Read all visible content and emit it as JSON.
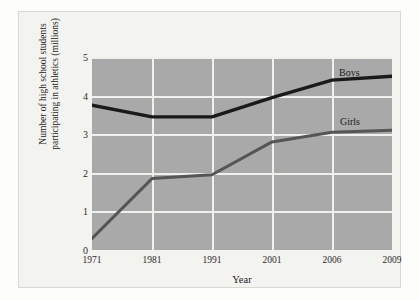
{
  "figure": {
    "background_color": "#f3f3f0",
    "plot_background_color": "#a9a9a9",
    "gridline_color": "#f0f0ec"
  },
  "axes": {
    "y_title_line1": "Number of high school students",
    "y_title_line2": "participating in athletics (millions)",
    "x_title": "Year",
    "y_ticks": [
      "5",
      "4",
      "3",
      "2",
      "1",
      "0"
    ],
    "x_ticks": [
      "1971",
      "1981",
      "1991",
      "2001",
      "2006",
      "2009"
    ]
  },
  "labels": {
    "boys": "Boys",
    "girls": "Girls"
  },
  "chart_data": {
    "type": "line",
    "title": "",
    "xlabel": "Year",
    "ylabel": "Number of high school students participating in athletics (millions)",
    "categories": [
      "1971",
      "1981",
      "1991",
      "2001",
      "2006",
      "2009"
    ],
    "x": [
      1971,
      1981,
      1991,
      2001,
      2006,
      2009
    ],
    "ylim": [
      0,
      5
    ],
    "yticks": [
      0,
      1,
      2,
      3,
      4,
      5
    ],
    "grid": true,
    "legend": "inline-series-labels",
    "series": [
      {
        "name": "Boys",
        "color": "#1a1a1a",
        "values": [
          3.75,
          3.45,
          3.45,
          3.95,
          4.4,
          4.5
        ]
      },
      {
        "name": "Girls",
        "color": "#555555",
        "values": [
          0.3,
          1.85,
          1.95,
          2.8,
          3.05,
          3.1
        ]
      }
    ]
  }
}
